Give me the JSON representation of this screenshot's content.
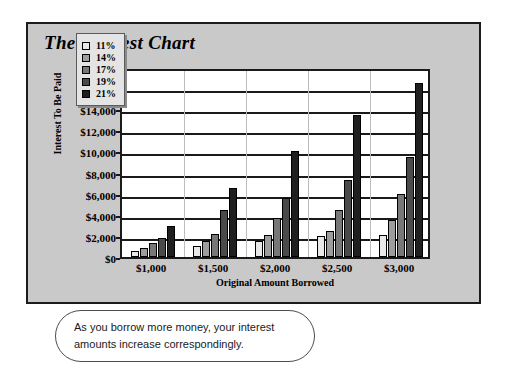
{
  "chart_data": {
    "type": "bar",
    "title": "The Interest Chart",
    "xlabel": "Original Amount Borrowed",
    "ylabel": "Interest To Be Paid",
    "categories": [
      "$1,000",
      "$1,500",
      "$2,000",
      "$2,500",
      "$3,000"
    ],
    "ylim": [
      0,
      18000
    ],
    "ytick_labels": [
      "$18,000",
      "$16,000",
      "$14,000",
      "$12,000",
      "$10,000",
      "$8,000",
      "$6,000",
      "$4,000",
      "$2,000",
      "$0"
    ],
    "ytick_values": [
      18000,
      16000,
      14000,
      12000,
      10000,
      8000,
      6000,
      4000,
      2000,
      0
    ],
    "ytick_step": 2000,
    "grid": true,
    "legend_position": "upper-left-inside",
    "series": [
      {
        "name": "11%",
        "color": "#e8e8e8",
        "values": [
          600,
          1000,
          1500,
          2000,
          2100
        ]
      },
      {
        "name": "14%",
        "color": "#9d9d9d",
        "values": [
          900,
          1500,
          2100,
          2500,
          3500
        ]
      },
      {
        "name": "17%",
        "color": "#777777",
        "values": [
          1300,
          2200,
          3700,
          4500,
          6000
        ]
      },
      {
        "name": "19%",
        "color": "#4a4a4a",
        "values": [
          1800,
          4500,
          5600,
          7300,
          9500
        ]
      },
      {
        "name": "21%",
        "color": "#1f1f1f",
        "values": [
          2900,
          6500,
          10000,
          13500,
          16500
        ]
      }
    ]
  },
  "legend": {
    "items": [
      {
        "label": "11%"
      },
      {
        "label": "14%"
      },
      {
        "label": "17%"
      },
      {
        "label": "19%"
      },
      {
        "label": "21%"
      }
    ]
  },
  "caption": {
    "line1": "As you borrow more money, your interest",
    "line2": "amounts increase correspondingly."
  },
  "colors": {
    "panel_background": "#c9c9c9",
    "panel_border": "#1c1c1c",
    "plot_background": "#ffffff",
    "axis": "#1a1a1a"
  }
}
